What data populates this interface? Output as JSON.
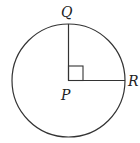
{
  "diagram": {
    "type": "circle-with-right-angle",
    "labels": {
      "q": "Q",
      "p": "P",
      "r": "R"
    },
    "circle": {
      "cx": 68.5,
      "cy": 80.5,
      "r": 56.5
    },
    "right_angle_marker_size": 15,
    "stroke_color": "#333333"
  }
}
